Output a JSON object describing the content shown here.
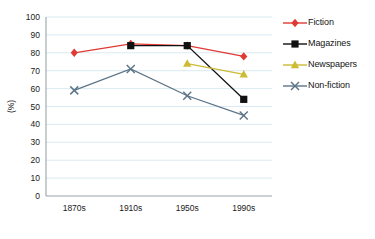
{
  "chart_data": {
    "type": "line",
    "title": "",
    "xlabel": "",
    "ylabel": "(%)",
    "categories": [
      "1870s",
      "1910s",
      "1950s",
      "1990s"
    ],
    "ylim": [
      0,
      100
    ],
    "yticks": [
      0,
      10,
      20,
      30,
      40,
      50,
      60,
      70,
      80,
      90,
      100
    ],
    "grid": true,
    "legend_position": "right",
    "series": [
      {
        "name": "Fiction",
        "color": "#e03a34",
        "marker": "diamond",
        "values": [
          80,
          85,
          84,
          78
        ]
      },
      {
        "name": "Magazines",
        "color": "#111111",
        "marker": "square",
        "values": [
          null,
          84,
          84,
          54
        ]
      },
      {
        "name": "Newspapers",
        "color": "#ccbb33",
        "marker": "triangle",
        "values": [
          null,
          null,
          74,
          68
        ]
      },
      {
        "name": "Non-fiction",
        "color": "#5b7487",
        "marker": "x",
        "values": [
          59,
          71,
          56,
          45
        ]
      }
    ]
  },
  "axis": {
    "y_label": "(%)",
    "y_ticks": [
      "0",
      "10",
      "20",
      "30",
      "40",
      "50",
      "60",
      "70",
      "80",
      "90",
      "100"
    ],
    "x_ticks": [
      "1870s",
      "1910s",
      "1950s",
      "1990s"
    ]
  },
  "legend": {
    "items": [
      {
        "label": "Fiction",
        "color": "#e03a34",
        "marker": "diamond"
      },
      {
        "label": "Magazines",
        "color": "#111111",
        "marker": "square"
      },
      {
        "label": "Newspapers",
        "color": "#ccbb33",
        "marker": "triangle"
      },
      {
        "label": "Non-fiction",
        "color": "#5b7487",
        "marker": "x"
      }
    ]
  }
}
